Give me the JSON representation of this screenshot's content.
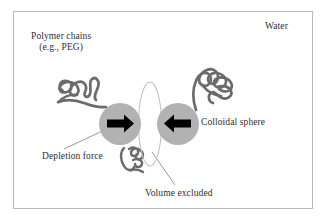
{
  "figure": {
    "type": "schematic-diagram",
    "background_color": "#ffffff",
    "frame_color": "#b9b9b9"
  },
  "labels": {
    "water": "Water",
    "polymer_chains_line1": "Polymer chains",
    "polymer_chains_line2": "(e.g., PEG)",
    "colloidal_sphere": "Colloidal sphere",
    "depletion_force": "Depletion force",
    "volume_excluded": "Volume excluded"
  },
  "colors": {
    "sphere_fill": "#b0b0b0",
    "polymer_stroke": "#6b6b6b",
    "arrow_fill": "#000000",
    "ellipse_stroke": "#bdbdbd",
    "leader_line": "#8c8c8c",
    "text": "#2e2e2e"
  },
  "elements": {
    "left_sphere": {
      "name": "colloidal-sphere-left",
      "cx": 120,
      "cy": 124,
      "r": 21
    },
    "right_sphere": {
      "name": "colloidal-sphere-right",
      "cx": 178,
      "cy": 124,
      "r": 21
    },
    "excluded_volume_ellipse": {
      "name": "excluded-volume-ellipse",
      "cx": 150,
      "cy": 124,
      "rx": 11,
      "ry": 42
    },
    "left_arrow": {
      "name": "depletion-force-arrow-left",
      "direction": "right"
    },
    "right_arrow": {
      "name": "depletion-force-arrow-right",
      "direction": "left"
    },
    "polymer_coils": [
      {
        "name": "polymer-coil-upper-left"
      },
      {
        "name": "polymer-coil-upper-right"
      },
      {
        "name": "polymer-coil-lower-center"
      }
    ]
  }
}
